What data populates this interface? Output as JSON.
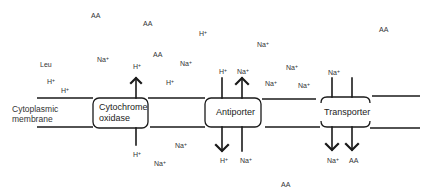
{
  "diagram": {
    "membrane_label": [
      "Cytoplasmic",
      "membrane"
    ],
    "proteins": [
      {
        "name": "cytochrome-oxidase",
        "label": [
          "Cytochrome",
          "oxidase"
        ],
        "box": {
          "x": 93,
          "y": 98,
          "w": 55,
          "h": 30
        }
      },
      {
        "name": "antiporter",
        "label": [
          "Antiporter"
        ],
        "box": {
          "x": 205,
          "y": 98,
          "w": 56,
          "h": 29
        }
      },
      {
        "name": "transporter",
        "label": [
          "Transporter"
        ],
        "box": {
          "x": 320,
          "y": 97,
          "w": 50,
          "h": 30
        }
      }
    ],
    "outside_labels": [
      {
        "text": "AA",
        "sup": "",
        "x": 91,
        "y": 12
      },
      {
        "text": "AA",
        "sup": "",
        "x": 143,
        "y": 20
      },
      {
        "text": "H",
        "sup": "+",
        "x": 199,
        "y": 30
      },
      {
        "text": "AA",
        "sup": "",
        "x": 153,
        "y": 51
      },
      {
        "text": "Na",
        "sup": "+",
        "x": 257,
        "y": 41
      },
      {
        "text": "Leu",
        "sup": "",
        "x": 40,
        "y": 61
      },
      {
        "text": "Na",
        "sup": "+",
        "x": 97,
        "y": 56
      },
      {
        "text": "Na",
        "sup": "+",
        "x": 180,
        "y": 60
      },
      {
        "text": "H",
        "sup": "+",
        "x": 133,
        "y": 63
      },
      {
        "text": "H",
        "sup": "+",
        "x": 166,
        "y": 79
      },
      {
        "text": "H",
        "sup": "+",
        "x": 47,
        "y": 78
      },
      {
        "text": "H",
        "sup": "+",
        "x": 61,
        "y": 87
      },
      {
        "text": "H",
        "sup": "+",
        "x": 219,
        "y": 68
      },
      {
        "text": "Na",
        "sup": "+",
        "x": 237,
        "y": 68
      },
      {
        "text": "Na",
        "sup": "+",
        "x": 286,
        "y": 64
      },
      {
        "text": "Na",
        "sup": "+",
        "x": 265,
        "y": 80
      },
      {
        "text": "Na",
        "sup": "+",
        "x": 298,
        "y": 82
      },
      {
        "text": "Na",
        "sup": "+",
        "x": 328,
        "y": 69
      },
      {
        "text": "AA",
        "sup": "",
        "x": 379,
        "y": 26
      }
    ],
    "inside_labels": [
      {
        "text": "H",
        "sup": "+",
        "x": 133,
        "y": 151
      },
      {
        "text": "Na",
        "sup": "+",
        "x": 175,
        "y": 142
      },
      {
        "text": "Na",
        "sup": "+",
        "x": 154,
        "y": 160
      },
      {
        "text": "H",
        "sup": "+",
        "x": 220,
        "y": 157
      },
      {
        "text": "Na",
        "sup": "+",
        "x": 240,
        "y": 157
      },
      {
        "text": "Na",
        "sup": "+",
        "x": 327,
        "y": 157
      },
      {
        "text": "AA",
        "sup": "",
        "x": 349,
        "y": 157
      },
      {
        "text": "AA",
        "sup": "",
        "x": 281,
        "y": 181
      }
    ],
    "colors": {
      "line": "#1a1a1a",
      "text": "#333333",
      "background": "#ffffff"
    }
  }
}
